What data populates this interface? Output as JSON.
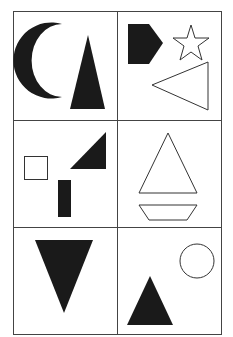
{
  "figure": {
    "type": "shape-grid",
    "rows": 3,
    "cols": 2,
    "colors": {
      "fill": "#1a1a1a",
      "stroke": "#333333",
      "grid": "#444444",
      "background": "#ffffff"
    },
    "cells": [
      {
        "row": 1,
        "col": 1,
        "shapes": [
          "black crescent moon",
          "black tall triangle"
        ]
      },
      {
        "row": 1,
        "col": 2,
        "shapes": [
          "black pentagon (arrow shape)",
          "outline star",
          "outline left-pointing triangle"
        ]
      },
      {
        "row": 2,
        "col": 1,
        "shapes": [
          "outline square",
          "black right triangle",
          "black vertical rectangle"
        ]
      },
      {
        "row": 2,
        "col": 2,
        "shapes": [
          "outline triangle",
          "outline trapezoid"
        ]
      },
      {
        "row": 3,
        "col": 1,
        "shapes": [
          "black downward triangle"
        ]
      },
      {
        "row": 3,
        "col": 2,
        "shapes": [
          "outline circle",
          "black upward triangle"
        ]
      }
    ]
  }
}
